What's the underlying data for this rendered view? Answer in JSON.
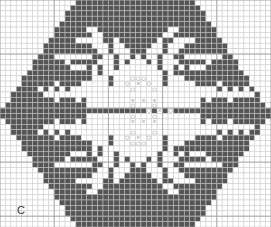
{
  "chart": {
    "label": "C",
    "cols": 50,
    "rows": 42,
    "colors": {
      "filled": "#555555",
      "empty": "#ffffff",
      "grid_line": "#cfcfcf",
      "grid_line_filled": "#bdbdbd",
      "major_line": "#9e9e9e",
      "symbol": "#777777"
    },
    "pattern": [
      "..............######################..............",
      ".............########################.............",
      ".............########################.............",
      "............##########################............",
      "...........############################...........",
      "...........#####..#############..######...........",
      "..........#######..###########..########..........",
      ".........#####.....##.#######.##....#####.........",
      ".........########...#..#####..#...########........",
      "........##########..#...###...#..##########.......",
      ".......###.......##..#..#.#..#..##.......###......",
      ".......#####.#####...#.#...#.#...#####.#####......",
      "......#######...#.#..#.......#..#.#...#######.....",
      "......###########.#...........#.###########.......",
      ".....############...#...ooo...#...############....",
      "....######.####.....#..o.x.o..#.....####.######...",
      "....###.#.#.#...........o...o...........#.#.#.###..",
      "...#####.......................................#####",
      "...#######.###.#........x.x.x........#.###.#######.",
      "..##############........o...o........#############",
      ".#.........................o.x.o.........................",
      "..##############........o...o........#############",
      "...#######.###.#........x.x.x........#.###.#######.",
      "...#####.......................................#####",
      "....###.#.#.#...........o...o...........#.#.#.###..",
      "....######.####.....#..o.x.o..#.....####.######...",
      ".....############...#...ooo...#...############....",
      "......###########.#...........#.###########.......",
      "......#######...#.#..#.......#..#.#...#######.....",
      ".......#####.#####...#.#...#.#...#####.#####......",
      ".......###.......##..#..#.#..#..##.......###......",
      "........##########..#...###...#..##########.......",
      ".........########...#..#####..#...########........",
      ".........#####.....##.#######.##....#####.........",
      "..........#######..###########..########..........",
      "...........#####..#############..######...........",
      "...........############################...........",
      "............##########################............",
      ".............########################.............",
      ".............########################.............",
      "..............######################..............",
      "..............######################.............."
    ]
  }
}
